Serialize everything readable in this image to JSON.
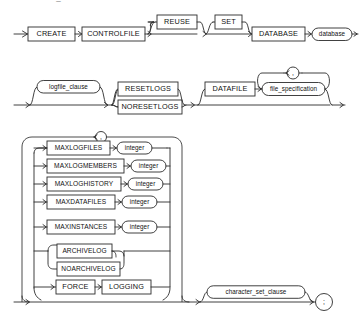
{
  "document": {
    "type": "railroad-syntax-diagram",
    "statement": "CREATE CONTROLFILE",
    "cut_off_header": "create_controlfile::="
  },
  "rows": {
    "row1": {
      "terminals": [
        {
          "label": "CREATE"
        },
        {
          "label": "CONTROLFILE"
        },
        {
          "label": "REUSE"
        },
        {
          "label": "SET"
        },
        {
          "label": "DATABASE"
        }
      ],
      "nonterminals": [
        {
          "label": "database"
        }
      ]
    },
    "row2": {
      "terminals": [
        {
          "label": "RESETLOGS"
        },
        {
          "label": "NORESETLOGS"
        },
        {
          "label": "DATAFILE"
        }
      ],
      "nonterminals": [
        {
          "label": "logfile_clause"
        },
        {
          "label": "file_specification"
        }
      ],
      "separator": ","
    },
    "row3": {
      "options": [
        {
          "keyword": "MAXLOGFILES",
          "argument": "integer"
        },
        {
          "keyword": "MAXLOGMEMBERS",
          "argument": "integer"
        },
        {
          "keyword": "MAXLOGHISTORY",
          "argument": "integer"
        },
        {
          "keyword": "MAXDATAFILES",
          "argument": "integer"
        },
        {
          "keyword": "MAXINSTANCES",
          "argument": "integer"
        }
      ],
      "archive_alternatives": [
        {
          "label": "ARCHIVELOG"
        },
        {
          "label": "NOARCHIVELOG"
        }
      ],
      "force_logging": [
        {
          "label": "FORCE"
        },
        {
          "label": "LOGGING"
        }
      ],
      "loop_separator": ",",
      "tail": {
        "nonterminal": "character_set_clause",
        "terminator": ";"
      }
    }
  },
  "colors": {
    "line": "#2b2b2b",
    "box_fill": "#ffffff",
    "text": "#111111",
    "background": "#ffffff"
  }
}
